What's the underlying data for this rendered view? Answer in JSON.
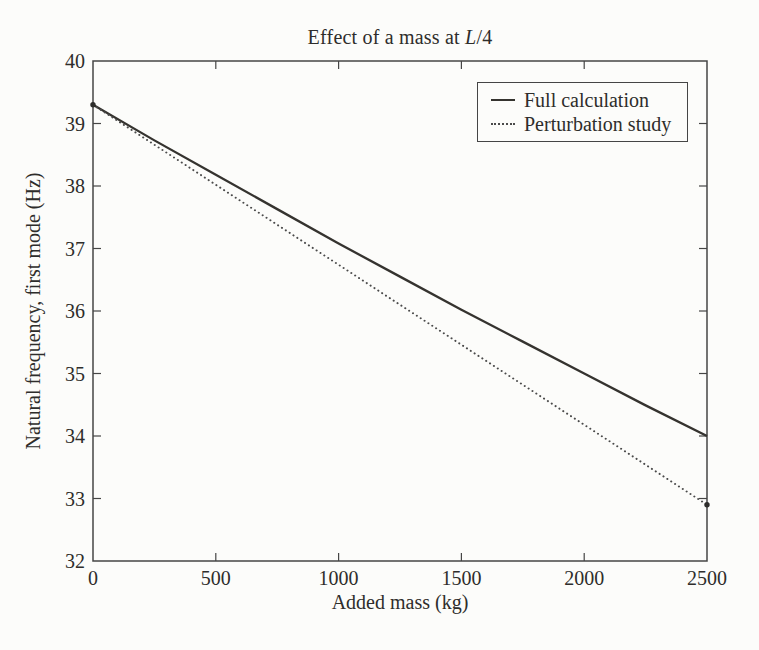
{
  "colors": {
    "ink": "#2e2d2b",
    "axis": "#454545"
  },
  "chart_data": {
    "type": "line",
    "title": "Effect of a mass at L/4",
    "title_prefix": "Effect of a mass at ",
    "title_var": "L",
    "title_suffix": "/4",
    "xlabel": "Added mass (kg)",
    "ylabel": "Natural frequency, first mode (Hz)",
    "xlim": [
      0,
      2500
    ],
    "ylim": [
      32,
      40
    ],
    "x_ticks": [
      0,
      500,
      1000,
      1500,
      2000,
      2500
    ],
    "y_ticks": [
      32,
      33,
      34,
      35,
      36,
      37,
      38,
      39,
      40
    ],
    "grid": false,
    "legend_position": "upper right",
    "x": [
      0,
      250,
      500,
      750,
      1000,
      1250,
      1500,
      1750,
      2000,
      2250,
      2500
    ],
    "series": [
      {
        "name": "Full calculation",
        "style": "solid",
        "color": "#35332f",
        "values": [
          39.3,
          38.73,
          38.18,
          37.63,
          37.08,
          36.55,
          36.02,
          35.51,
          35.0,
          34.49,
          34.0
        ]
      },
      {
        "name": "Perturbation study",
        "style": "dotted",
        "color": "#4a4a4a",
        "values": [
          39.3,
          38.66,
          38.02,
          37.38,
          36.74,
          36.1,
          35.46,
          34.82,
          34.18,
          33.54,
          32.9
        ]
      }
    ],
    "end_markers": [
      {
        "x": 0,
        "y": 39.3
      },
      {
        "x": 2500,
        "y": 32.9
      }
    ]
  }
}
